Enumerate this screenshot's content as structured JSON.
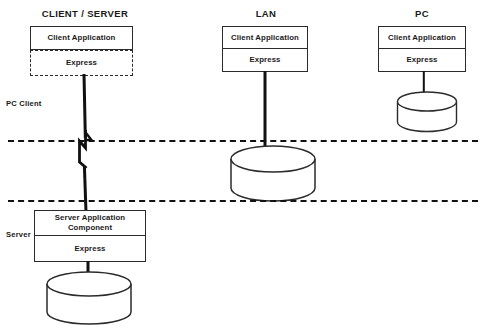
{
  "diagram": {
    "title_row": [
      {
        "label": "CLIENT / SERVER",
        "x": 85,
        "y": 8
      },
      {
        "label": "LAN",
        "x": 266,
        "y": 8
      },
      {
        "label": "PC",
        "x": 422,
        "y": 8
      }
    ],
    "zone_labels": [
      {
        "label": "PC Client",
        "x": 6,
        "y": 99
      },
      {
        "label": "Server",
        "x": 6,
        "y": 230
      }
    ],
    "columns": {
      "client_server": {
        "title": "CLIENT / SERVER",
        "client_node": {
          "application_label": "Client Application",
          "middleware_label": "Express"
        },
        "server_node": {
          "application_label": "Server Application Component",
          "middleware_label": "Express"
        }
      },
      "lan": {
        "title": "LAN",
        "node": {
          "application_label": "Client Application",
          "middleware_label": "Express"
        }
      },
      "pc": {
        "title": "PC",
        "node": {
          "application_label": "Client Application",
          "middleware_label": "Express"
        }
      }
    },
    "boundaries": [
      {
        "name": "upper-boundary",
        "y": 140
      },
      {
        "name": "lower-boundary",
        "y": 200
      }
    ],
    "databases": [
      {
        "name": "pc-database"
      },
      {
        "name": "lan-database"
      },
      {
        "name": "server-database"
      }
    ],
    "colors": {
      "stroke": "#2b2b2b",
      "connector": "#111111",
      "text": "#1a1a1a",
      "background": "#ffffff"
    }
  }
}
